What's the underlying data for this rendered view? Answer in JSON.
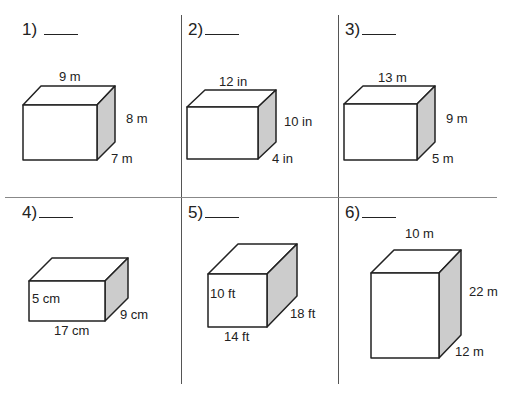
{
  "worksheet": {
    "problems": [
      {
        "number": "1)",
        "dims": {
          "top": "9 m",
          "right": "8 m",
          "depth": "7 m"
        }
      },
      {
        "number": "2)",
        "dims": {
          "top": "12 in",
          "right": "10 in",
          "depth": "4 in"
        }
      },
      {
        "number": "3)",
        "dims": {
          "top": "13 m",
          "right": "9 m",
          "depth": "5 m"
        }
      },
      {
        "number": "4)",
        "dims": {
          "height": "5 cm",
          "bottom": "17 cm",
          "depth": "9 cm"
        }
      },
      {
        "number": "5)",
        "dims": {
          "height": "10 ft",
          "bottom": "14 ft",
          "depth": "18 ft"
        }
      },
      {
        "number": "6)",
        "dims": {
          "top": "10 m",
          "right": "22 m",
          "depth": "12 m"
        }
      }
    ],
    "colors": {
      "line": "#222222",
      "side_face": "#cccccc",
      "grid": "#666666"
    }
  }
}
